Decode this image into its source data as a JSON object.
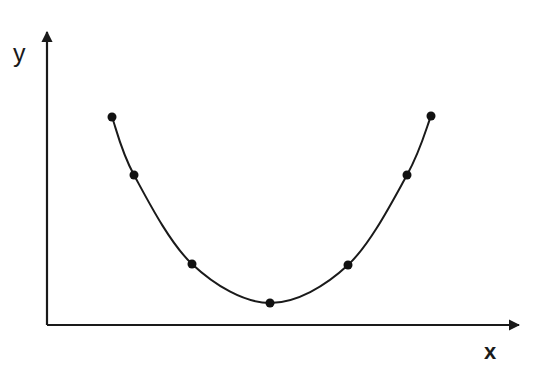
{
  "figure": {
    "title": "",
    "background_color": "#ffffff",
    "width": 542,
    "height": 374
  },
  "axes": {
    "x_label": "x",
    "y_label": "y",
    "axis_color": "#1a1a1a",
    "axis_line_width": 2,
    "arrowheads": true,
    "origin_px": {
      "x": 47,
      "y": 325
    },
    "x_axis_end_px": {
      "x": 527,
      "y": 325
    },
    "y_axis_end_px": {
      "x": 47,
      "y": 27
    },
    "ticks": "none",
    "tick_labels": "none",
    "grid": false
  },
  "series": {
    "name": "fitted-curve",
    "curve_color": "#1a1a1a",
    "curve_width": 2,
    "marker_color": "#111111",
    "marker_shape": "circle",
    "marker_radius_px": 4.5,
    "legend": "none"
  },
  "chart_data": {
    "type": "line",
    "title": "",
    "xlabel": "x",
    "ylabel": "y",
    "grid": false,
    "legend_position": "none",
    "axis_ticks_shown": false,
    "series": [
      {
        "name": "parabola",
        "marker": "filled-circle",
        "line": "smooth-curve",
        "points_px": [
          {
            "x": 112,
            "y": 117
          },
          {
            "x": 134,
            "y": 175
          },
          {
            "x": 192,
            "y": 264
          },
          {
            "x": 270,
            "y": 303
          },
          {
            "x": 348,
            "y": 265
          },
          {
            "x": 407,
            "y": 175
          },
          {
            "x": 431,
            "y": 116
          }
        ],
        "x": [
          -3,
          -2.5,
          -1.5,
          -0.25,
          1,
          2.2,
          2.7
        ],
        "values": [
          8.8,
          6.0,
          1.7,
          0.05,
          1.6,
          5.9,
          8.8
        ]
      }
    ],
    "xlim": [
      -3.4,
      3.2
    ],
    "ylim": [
      0,
      10.5
    ]
  }
}
